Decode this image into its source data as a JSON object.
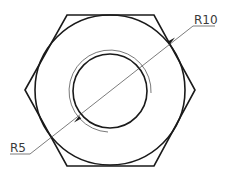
{
  "drawing": {
    "type": "hex-nut-top-view",
    "colors": {
      "stroke": "#1a1a1a",
      "thin_stroke": "#555555",
      "label": "#3a3a3a",
      "background": "#ffffff"
    },
    "hexagon": {
      "center": [
        110,
        90
      ],
      "vertices": [
        [
          25,
          90
        ],
        [
          67,
          15
        ],
        [
          154,
          15
        ],
        [
          195,
          90
        ],
        [
          154,
          166
        ],
        [
          67,
          166
        ]
      ]
    },
    "outer_circle": {
      "center": [
        110,
        90
      ],
      "radius": 75
    },
    "inner_circle": {
      "center": [
        110,
        91
      ],
      "radius": 37
    },
    "thread_arc": {
      "center": [
        110,
        91
      ],
      "radius": 41,
      "sweep_deg": 270
    },
    "dimensions": [
      {
        "id": "r10",
        "label": "R10",
        "arrow_at": [
          172,
          40
        ],
        "leader_to": [
          193,
          26
        ],
        "underline": [
          [
            193,
            26
          ],
          [
            215,
            26
          ]
        ]
      },
      {
        "id": "r5",
        "label": "R5",
        "arrow_at": [
          77,
          120
        ],
        "leader_to": [
          30,
          154
        ],
        "underline": [
          [
            10,
            154
          ],
          [
            30,
            154
          ]
        ]
      }
    ]
  }
}
